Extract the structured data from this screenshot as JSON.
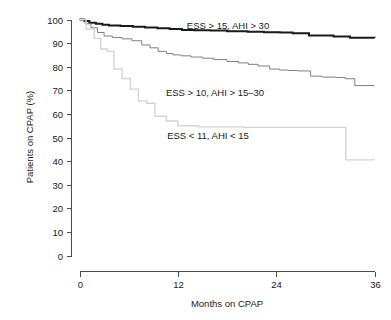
{
  "chart_data": {
    "type": "line",
    "title": "",
    "subtitle": "",
    "xlabel": "Months on CPAP",
    "ylabel": "Patients on CPAP (%)",
    "xlim": [
      0,
      36
    ],
    "ylim": [
      0,
      100
    ],
    "xticks": [
      0,
      12,
      24,
      36
    ],
    "xtick_labels": [
      "0",
      "12",
      "24",
      "36"
    ],
    "yticks": [
      0,
      10,
      20,
      30,
      40,
      50,
      60,
      70,
      80,
      90,
      100
    ],
    "ytick_labels": [
      "0",
      "10",
      "20",
      "30",
      "40",
      "50",
      "60",
      "70",
      "80",
      "90",
      "100"
    ],
    "grid": false,
    "legend_position": "inline-annotations",
    "step_plot": true,
    "series": [
      {
        "name": "ESS > 15, AHI > 30",
        "color": "#1a1a1a",
        "line_width": 2.0,
        "annotation": "ESS > 15, AHI > 30",
        "annotation_x": 22.0,
        "annotation_y": 95.5,
        "x": [
          0,
          0.6,
          1.2,
          2.0,
          2.8,
          3.6,
          5.0,
          6.5,
          8.0,
          9.5,
          11.0,
          12.5,
          14.0,
          16.0,
          18.0,
          20.5,
          22.5,
          24.5,
          26.0,
          28.0,
          31.0,
          33.0,
          36
        ],
        "y": [
          100,
          99.4,
          98.6,
          98.2,
          97.8,
          97.5,
          97.2,
          96.9,
          96.6,
          96.3,
          96.0,
          95.6,
          95.4,
          95.3,
          95.0,
          94.8,
          94.6,
          94.5,
          94.2,
          93.2,
          92.8,
          92.3,
          92.2
        ]
      },
      {
        "name": "ESS > 10, AHI > 15-30",
        "color": "#808080",
        "line_width": 1.0,
        "annotation": "ESS > 10, AHI > 15–30",
        "annotation_x": 20.0,
        "annotation_y": 72.5,
        "x": [
          0,
          0.7,
          1.4,
          2.2,
          3.0,
          4.0,
          5.2,
          6.4,
          7.6,
          8.6,
          9.6,
          10.6,
          11.4,
          12.4,
          13.6,
          15.0,
          16.4,
          18.0,
          19.4,
          20.6,
          21.8,
          23.2,
          24.4,
          25.4,
          26.6,
          28.2,
          29.6,
          31.2,
          32.4,
          33.6,
          36
        ],
        "y": [
          100,
          98.2,
          96.5,
          94.5,
          93.0,
          92.4,
          91.8,
          91.0,
          89.2,
          88.0,
          86.5,
          85.6,
          85.0,
          84.6,
          84.1,
          83.6,
          83.0,
          82.2,
          81.6,
          81.0,
          80.3,
          79.0,
          78.6,
          78.4,
          78.2,
          76.0,
          75.6,
          75.4,
          74.9,
          72.0,
          72.0
        ]
      },
      {
        "name": "ESS < 11, AHI < 15",
        "color": "#d4d4d4",
        "line_width": 1.4,
        "annotation": "ESS < 11, AHI < 15",
        "annotation_x": 13.5,
        "annotation_y": 49.0,
        "x": [
          0,
          0.8,
          1.8,
          2.6,
          3.4,
          4.2,
          5.2,
          6.2,
          7.2,
          8.2,
          9.2,
          10.6,
          12.0,
          14.5,
          17.5,
          20.0,
          23.0,
          26.0,
          31.5,
          32.5,
          36
        ],
        "y": [
          100,
          96.0,
          92.0,
          87.5,
          86.5,
          79.0,
          75.0,
          70.5,
          65.5,
          64.5,
          59.0,
          57.0,
          55.0,
          54.5,
          54.5,
          54.3,
          54.3,
          54.3,
          54.3,
          40.5,
          40.5
        ]
      }
    ]
  },
  "axes": {
    "ytick_labels": [
      "100",
      "90",
      "80",
      "70",
      "60",
      "50",
      "40",
      "30",
      "20",
      "10",
      "0"
    ],
    "xtick_labels": [
      "0",
      "12",
      "24",
      "36"
    ],
    "xlabel": "Months on CPAP",
    "ylabel": "Patients on CPAP (%)"
  },
  "annotations": [
    {
      "text": "ESS > 15, AHI > 30",
      "x": 228,
      "y": 29
    },
    {
      "text": "ESS > 10, AHI > 15–30",
      "x": 215,
      "y": 96
    },
    {
      "text": "ESS < 11, AHI < 15",
      "x": 208,
      "y": 139
    }
  ]
}
